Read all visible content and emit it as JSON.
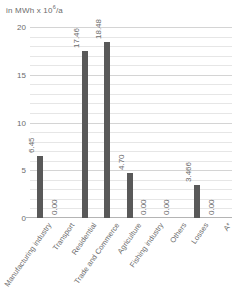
{
  "chart_data": {
    "type": "bar",
    "title_prefix": "in MWh x 10",
    "title_exponent": "6",
    "title_suffix": "/a",
    "xlabel": "",
    "ylabel": "",
    "ylim": [
      0,
      20
    ],
    "yticks": [
      0,
      5,
      10,
      15,
      20
    ],
    "ytick_labels": [
      "0",
      "5",
      "10",
      "15",
      "20"
    ],
    "minor_gridline_step": 1,
    "grid": true,
    "legend": "none",
    "bar_color": "#595959",
    "categories": [
      "Manufacturing industry",
      "Transport",
      "Residential",
      "Trade and Commerce",
      "Agriculture",
      "Fishing industry",
      "Others",
      "Losses",
      "A*"
    ],
    "values": [
      6.45,
      0.0,
      17.46,
      18.48,
      4.7,
      0.0,
      0.0,
      3.466,
      0.0
    ],
    "value_labels": [
      "6.45",
      "0.00",
      "17.46",
      "18.48",
      "4.70",
      "0.00",
      "0.00",
      "3.466",
      "0.00"
    ]
  }
}
